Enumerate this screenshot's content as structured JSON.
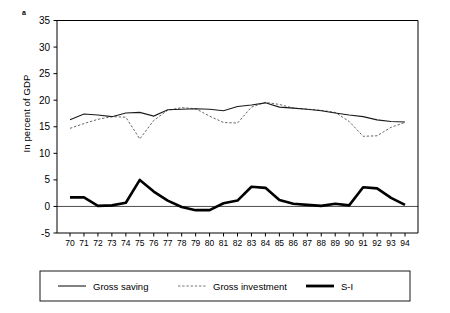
{
  "figure": {
    "panel_label": "a",
    "ylabel": "In percent of GDP"
  },
  "chart_data": {
    "type": "line",
    "title": "",
    "xlabel": "",
    "ylabel": "In percent of GDP",
    "ylim": [
      -5,
      35
    ],
    "yticks": [
      -5,
      0,
      5,
      10,
      15,
      20,
      25,
      30,
      35
    ],
    "ytick_labels": [
      "-5",
      "0",
      "5",
      "10",
      "15",
      "20",
      "25",
      "30",
      "35"
    ],
    "grid": false,
    "legend_position": "bottom",
    "x": [
      70,
      71,
      72,
      73,
      74,
      75,
      76,
      77,
      78,
      79,
      80,
      81,
      82,
      83,
      84,
      85,
      86,
      87,
      88,
      89,
      90,
      91,
      92,
      93,
      94
    ],
    "xtick_labels": [
      "70",
      "71",
      "72",
      "73",
      "74",
      "75",
      "76",
      "77",
      "78",
      "79",
      "80",
      "81",
      "82",
      "83",
      "84",
      "85",
      "86",
      "87",
      "88",
      "89",
      "90",
      "91",
      "92",
      "93",
      "94"
    ],
    "series": [
      {
        "name": "Gross saving",
        "style": "solid-thin",
        "color": "#1a1a1a",
        "values": [
          16.3,
          17.4,
          17.2,
          16.9,
          17.6,
          17.7,
          17.0,
          18.2,
          18.3,
          18.4,
          18.3,
          18.0,
          18.8,
          19.1,
          19.5,
          18.7,
          18.5,
          18.3,
          18.0,
          17.6,
          17.2,
          16.9,
          16.3,
          16.0,
          15.9
        ]
      },
      {
        "name": "Gross investment",
        "style": "dotted",
        "color": "#555555",
        "values": [
          14.7,
          15.6,
          16.4,
          16.9,
          16.8,
          12.7,
          16.2,
          18.1,
          18.6,
          18.4,
          17.0,
          15.8,
          15.7,
          18.7,
          19.6,
          19.2,
          18.5,
          18.3,
          18.1,
          17.7,
          16.0,
          13.2,
          13.3,
          14.9,
          15.8
        ]
      },
      {
        "name": "S-I",
        "style": "solid-thick",
        "color": "#000000",
        "values": [
          1.7,
          1.7,
          0.1,
          0.2,
          0.7,
          5.0,
          2.8,
          1.1,
          -0.1,
          -0.7,
          -0.7,
          0.6,
          1.1,
          3.7,
          3.5,
          1.2,
          0.5,
          0.3,
          0.1,
          0.5,
          0.2,
          3.6,
          3.4,
          1.6,
          0.3
        ]
      }
    ]
  },
  "legend": {
    "items": [
      {
        "label": "Gross saving",
        "marker": "solid-thin-line"
      },
      {
        "label": "Gross investment",
        "marker": "dotted-line"
      },
      {
        "label": "S-I",
        "marker": "solid-thick-line"
      }
    ]
  }
}
